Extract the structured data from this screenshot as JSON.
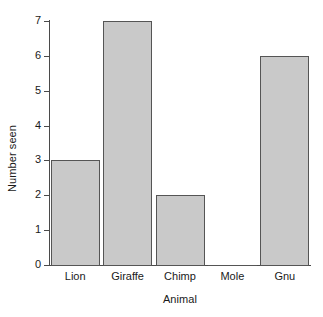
{
  "chart_data": {
    "type": "bar",
    "title": "",
    "xlabel": "Animal",
    "ylabel": "Number seen",
    "categories": [
      "Lion",
      "Giraffe",
      "Chimp",
      "Mole",
      "Gnu"
    ],
    "values": [
      3,
      7,
      2,
      0,
      6
    ],
    "ylim": [
      0,
      7
    ],
    "yticks": [
      0,
      1,
      2,
      3,
      4,
      5,
      6,
      7
    ],
    "ytick_labels": [
      "0",
      "1",
      "2",
      "3",
      "4",
      "5",
      "6",
      "7"
    ],
    "grid": false,
    "legend": false,
    "legend_position": "none",
    "bar_fill_color": "#c9c9c9",
    "bar_edge_color": "#555555",
    "axis_color": "#4a4a4a",
    "background_color": "#ffffff"
  }
}
